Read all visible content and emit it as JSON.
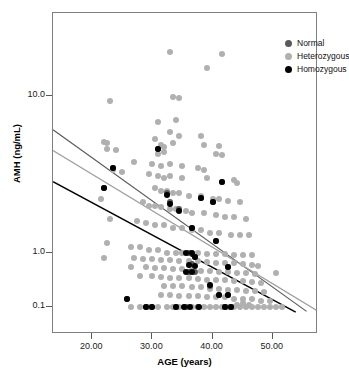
{
  "chart_data": {
    "type": "scatter",
    "title": "",
    "xlabel": "AGE (years)",
    "ylabel": "AMH (ng/mL)",
    "xlim": [
      13.5,
      57.5
    ],
    "ylim": [
      0.075,
      45
    ],
    "yscale": "log",
    "xscale": "linear",
    "grid": false,
    "legend_position": "top-right",
    "xticks": [
      "20.00",
      "30.00",
      "40.00",
      "50.00"
    ],
    "xtick_values": [
      20,
      30,
      40,
      50
    ],
    "yticks": [
      "10.0",
      "1.0",
      "0.1"
    ],
    "ytick_values": [
      10.0,
      1.0,
      0.1
    ],
    "series": [
      {
        "name": "Normal",
        "color": "#5a5a5a",
        "marker": "circle",
        "points": [
          [
            22.0,
            2.6
          ],
          [
            23.5,
            3.5
          ],
          [
            31.0,
            4.6
          ],
          [
            32.5,
            2.4
          ],
          [
            33.0,
            2.1
          ],
          [
            34.5,
            1.9
          ],
          [
            36.5,
            1.45
          ],
          [
            38.0,
            2.25
          ],
          [
            40.0,
            2.1
          ],
          [
            41.5,
            2.85
          ],
          [
            40.5,
            1.2
          ],
          [
            42.5,
            0.55
          ],
          [
            36.0,
            1.0
          ],
          [
            37.0,
            0.85
          ],
          [
            36.5,
            0.62
          ],
          [
            37.0,
            0.45
          ],
          [
            36.0,
            0.45
          ],
          [
            39.5,
            0.25
          ],
          [
            41.0,
            0.17
          ],
          [
            42.5,
            0.17
          ],
          [
            25.8,
            0.14
          ],
          [
            29.0,
            0.1
          ],
          [
            30.0,
            0.1
          ],
          [
            34.0,
            0.1
          ],
          [
            35.5,
            0.1
          ],
          [
            37.5,
            0.1
          ],
          [
            42.0,
            0.1
          ],
          [
            43.0,
            0.1
          ]
        ]
      },
      {
        "name": "Heterozygous",
        "color": "#b0b0b0",
        "marker": "circle",
        "points": [
          [
            34.0,
            36.0
          ],
          [
            33.0,
            19.0
          ],
          [
            41.5,
            18.5
          ],
          [
            39.0,
            15.0
          ],
          [
            23.0,
            9.3
          ],
          [
            33.5,
            9.8
          ],
          [
            34.5,
            9.7
          ],
          [
            31.0,
            6.8
          ],
          [
            34.0,
            7.0
          ],
          [
            33.0,
            5.9
          ],
          [
            34.5,
            5.6
          ],
          [
            38.0,
            5.6
          ],
          [
            22.0,
            5.1
          ],
          [
            22.5,
            5.0
          ],
          [
            30.5,
            5.3
          ],
          [
            31.5,
            4.9
          ],
          [
            32.0,
            4.7
          ],
          [
            33.5,
            5.0
          ],
          [
            38.5,
            4.9
          ],
          [
            41.0,
            4.8
          ],
          [
            22.5,
            4.6
          ],
          [
            24.0,
            4.5
          ],
          [
            31.0,
            4.3
          ],
          [
            32.0,
            4.4
          ],
          [
            40.5,
            4.3
          ],
          [
            41.5,
            4.2
          ],
          [
            27.0,
            3.8
          ],
          [
            30.0,
            3.7
          ],
          [
            31.5,
            3.6
          ],
          [
            33.0,
            3.7
          ],
          [
            35.0,
            3.6
          ],
          [
            37.5,
            3.5
          ],
          [
            38.5,
            3.4
          ],
          [
            23.5,
            3.4
          ],
          [
            25.0,
            3.3
          ],
          [
            29.5,
            3.2
          ],
          [
            31.0,
            3.1
          ],
          [
            32.0,
            3.0
          ],
          [
            33.0,
            3.1
          ],
          [
            35.0,
            3.0
          ],
          [
            39.0,
            3.0
          ],
          [
            43.5,
            2.9
          ],
          [
            44.0,
            2.8
          ],
          [
            30.5,
            2.6
          ],
          [
            31.5,
            2.5
          ],
          [
            32.5,
            2.5
          ],
          [
            33.5,
            2.4
          ],
          [
            34.5,
            2.4
          ],
          [
            36.0,
            2.3
          ],
          [
            38.0,
            2.3
          ],
          [
            40.0,
            2.2
          ],
          [
            41.0,
            2.2
          ],
          [
            42.5,
            2.15
          ],
          [
            44.5,
            2.1
          ],
          [
            21.5,
            2.2
          ],
          [
            28.5,
            2.1
          ],
          [
            29.5,
            2.0
          ],
          [
            30.5,
            2.0
          ],
          [
            31.5,
            1.95
          ],
          [
            33.0,
            1.9
          ],
          [
            34.0,
            1.9
          ],
          [
            35.5,
            1.85
          ],
          [
            36.5,
            1.8
          ],
          [
            38.5,
            1.8
          ],
          [
            40.5,
            1.75
          ],
          [
            42.0,
            1.7
          ],
          [
            43.5,
            1.7
          ],
          [
            45.5,
            1.65
          ],
          [
            23.0,
            1.65
          ],
          [
            27.5,
            1.6
          ],
          [
            29.0,
            1.55
          ],
          [
            30.5,
            1.5
          ],
          [
            32.0,
            1.5
          ],
          [
            33.5,
            1.45
          ],
          [
            35.0,
            1.45
          ],
          [
            36.5,
            1.4
          ],
          [
            38.0,
            1.4
          ],
          [
            39.5,
            1.35
          ],
          [
            41.0,
            1.35
          ],
          [
            43.0,
            1.3
          ],
          [
            44.5,
            1.3
          ],
          [
            46.0,
            1.3
          ],
          [
            22.5,
            1.15
          ],
          [
            26.5,
            1.1
          ],
          [
            28.0,
            1.1
          ],
          [
            29.5,
            1.05
          ],
          [
            31.0,
            1.05
          ],
          [
            32.5,
            1.0
          ],
          [
            34.0,
            1.0
          ],
          [
            35.0,
            1.0
          ],
          [
            36.0,
            1.0
          ],
          [
            37.5,
            0.98
          ],
          [
            39.0,
            0.97
          ],
          [
            40.5,
            0.95
          ],
          [
            42.0,
            0.94
          ],
          [
            43.5,
            0.93
          ],
          [
            45.0,
            0.92
          ],
          [
            46.5,
            0.9
          ],
          [
            22.0,
            0.82
          ],
          [
            27.0,
            0.8
          ],
          [
            28.5,
            0.78
          ],
          [
            30.0,
            0.77
          ],
          [
            31.5,
            0.75
          ],
          [
            33.0,
            0.74
          ],
          [
            34.5,
            0.72
          ],
          [
            36.0,
            0.7
          ],
          [
            37.5,
            0.7
          ],
          [
            39.0,
            0.68
          ],
          [
            40.5,
            0.66
          ],
          [
            42.0,
            0.65
          ],
          [
            43.5,
            0.64
          ],
          [
            45.0,
            0.62
          ],
          [
            46.5,
            0.6
          ],
          [
            47.5,
            0.58
          ],
          [
            26.5,
            0.56
          ],
          [
            29.0,
            0.54
          ],
          [
            30.5,
            0.52
          ],
          [
            32.0,
            0.52
          ],
          [
            33.5,
            0.5
          ],
          [
            35.0,
            0.5
          ],
          [
            36.5,
            0.48
          ],
          [
            38.0,
            0.47
          ],
          [
            39.5,
            0.46
          ],
          [
            41.0,
            0.45
          ],
          [
            42.5,
            0.44
          ],
          [
            44.0,
            0.43
          ],
          [
            45.5,
            0.42
          ],
          [
            47.0,
            0.41
          ],
          [
            50.5,
            0.42
          ],
          [
            28.0,
            0.38
          ],
          [
            30.0,
            0.37
          ],
          [
            31.5,
            0.36
          ],
          [
            33.0,
            0.35
          ],
          [
            34.5,
            0.35
          ],
          [
            36.0,
            0.34
          ],
          [
            37.5,
            0.33
          ],
          [
            39.0,
            0.32
          ],
          [
            40.5,
            0.32
          ],
          [
            42.0,
            0.31
          ],
          [
            43.5,
            0.3
          ],
          [
            45.0,
            0.3
          ],
          [
            46.5,
            0.29
          ],
          [
            48.0,
            0.28
          ],
          [
            32.0,
            0.25
          ],
          [
            33.5,
            0.24
          ],
          [
            35.0,
            0.24
          ],
          [
            36.5,
            0.23
          ],
          [
            38.0,
            0.23
          ],
          [
            39.5,
            0.22
          ],
          [
            41.0,
            0.22
          ],
          [
            42.5,
            0.21
          ],
          [
            44.0,
            0.21
          ],
          [
            45.5,
            0.2
          ],
          [
            47.0,
            0.2
          ],
          [
            48.5,
            0.19
          ],
          [
            31.5,
            0.17
          ],
          [
            33.0,
            0.17
          ],
          [
            34.5,
            0.16
          ],
          [
            36.0,
            0.16
          ],
          [
            37.5,
            0.16
          ],
          [
            39.0,
            0.15
          ],
          [
            40.5,
            0.15
          ],
          [
            42.0,
            0.15
          ],
          [
            43.5,
            0.14
          ],
          [
            45.0,
            0.14
          ],
          [
            46.5,
            0.14
          ],
          [
            48.0,
            0.13
          ],
          [
            49.5,
            0.13
          ],
          [
            26.5,
            0.1
          ],
          [
            28.0,
            0.1
          ],
          [
            29.5,
            0.1
          ],
          [
            31.0,
            0.1
          ],
          [
            32.5,
            0.1
          ],
          [
            33.5,
            0.1
          ],
          [
            34.5,
            0.1
          ],
          [
            35.5,
            0.1
          ],
          [
            36.5,
            0.1
          ],
          [
            37.5,
            0.1
          ],
          [
            38.5,
            0.1
          ],
          [
            39.5,
            0.1
          ],
          [
            40.5,
            0.1
          ],
          [
            41.5,
            0.1
          ],
          [
            42.5,
            0.1
          ],
          [
            43.5,
            0.1
          ],
          [
            44.5,
            0.1
          ],
          [
            45.5,
            0.1
          ],
          [
            46.5,
            0.1
          ],
          [
            47.5,
            0.1
          ],
          [
            48.5,
            0.1
          ],
          [
            49.5,
            0.1
          ],
          [
            50.5,
            0.1
          ],
          [
            51.5,
            0.1
          ],
          [
            44.0,
            0.11
          ],
          [
            45.0,
            0.12
          ],
          [
            46.0,
            0.11
          ]
        ]
      },
      {
        "name": "Homozygous",
        "color": "#000000",
        "marker": "circle",
        "points": [
          [
            31.0,
            4.6
          ],
          [
            23.5,
            3.5
          ],
          [
            22.0,
            2.6
          ],
          [
            41.5,
            2.85
          ],
          [
            38.0,
            2.25
          ],
          [
            40.0,
            2.1
          ],
          [
            32.5,
            2.35
          ],
          [
            33.0,
            2.05
          ],
          [
            34.5,
            1.85
          ],
          [
            36.5,
            1.45
          ],
          [
            40.5,
            1.2
          ],
          [
            35.5,
            1.0
          ],
          [
            36.5,
            1.0
          ],
          [
            37.0,
            0.85
          ],
          [
            36.0,
            0.6
          ],
          [
            37.0,
            0.58
          ],
          [
            42.5,
            0.55
          ],
          [
            35.5,
            0.45
          ],
          [
            36.5,
            0.45
          ],
          [
            39.5,
            0.26
          ],
          [
            41.0,
            0.17
          ],
          [
            42.5,
            0.17
          ],
          [
            25.8,
            0.14
          ],
          [
            29.0,
            0.1
          ],
          [
            30.0,
            0.1
          ],
          [
            34.0,
            0.1
          ],
          [
            35.2,
            0.1
          ],
          [
            36.2,
            0.1
          ],
          [
            37.8,
            0.1
          ],
          [
            42.0,
            0.1
          ],
          [
            43.0,
            0.1
          ]
        ]
      }
    ],
    "trend_lines": [
      {
        "name": "Normal",
        "color": "#5a5a5a",
        "width": 1.2,
        "x1": 13.5,
        "y1": 6.1,
        "x2": 55.6,
        "y2": 0.083
      },
      {
        "name": "Heterozygous",
        "color": "#9e9e9e",
        "width": 1.2,
        "x1": 13.5,
        "y1": 4.5,
        "x2": 57.4,
        "y2": 0.085
      },
      {
        "name": "Homozygous",
        "color": "#000000",
        "width": 1.4,
        "x1": 13.5,
        "y1": 2.85,
        "x2": 53.8,
        "y2": 0.08
      }
    ]
  },
  "legend": {
    "items": [
      {
        "label": "Normal",
        "swatch_class": "normal"
      },
      {
        "label": "Heterozygous",
        "swatch_class": "het"
      },
      {
        "label": "Homozygous",
        "swatch_class": "hom"
      }
    ]
  },
  "axes": {
    "x_title": "AGE (years)",
    "y_title": "AMH (ng/mL)"
  }
}
